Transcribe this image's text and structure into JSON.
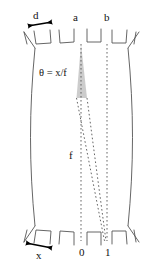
{
  "figure": {
    "type": "optical-ray-diagram",
    "background_color": "#ffffff",
    "outline_color": "#555555",
    "ray_color": "#555555",
    "wedge_fill": "#c9c9c9",
    "arrow_color": "#000000",
    "text_color": "#111111"
  },
  "labels": {
    "pitch": "d",
    "channel_a": "a",
    "channel_b": "b",
    "angle_equation": "θ = x/f",
    "focal_length": "f",
    "displacement": "x",
    "index_zero": "0",
    "index_one": "1"
  },
  "annotations": {
    "top_arrow_name": "pitch-arrow",
    "bottom_arrow_name": "displacement-arrow",
    "notch_count_top": 6,
    "notch_count_bottom": 6
  },
  "geometry": {
    "wedge_apex": [
      81,
      44
    ],
    "wedge_base_left": [
      76,
      98
    ],
    "wedge_base_right": [
      88,
      98
    ],
    "ray_a_top": [
      81,
      44
    ],
    "ray_a_bottom": [
      81,
      240
    ],
    "ray_b_top": [
      107,
      44
    ],
    "ray_b_bottom": [
      107,
      240
    ],
    "ray_c_bottom": [
      105,
      240
    ]
  }
}
